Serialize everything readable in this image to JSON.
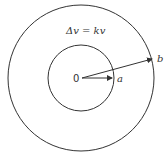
{
  "diagram": {
    "equation": "Δv = kv",
    "center_label": "0",
    "inner_radius_label": "a",
    "outer_radius_label": "b",
    "stroke_color": "#333333"
  }
}
